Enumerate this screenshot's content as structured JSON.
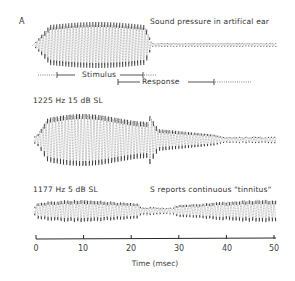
{
  "panel_label": "A",
  "chart_data": {
    "type": "line",
    "title": "",
    "xlabel": "Time (msec)",
    "ylabel": "",
    "xlim": [
      0,
      50
    ],
    "x_ticks": [
      0,
      10,
      20,
      30,
      40,
      50
    ],
    "tick_labels": [
      "0",
      "10",
      "20",
      "30",
      "40",
      "50"
    ],
    "grid": false,
    "traces": [
      {
        "name": "Sound pressure in artificial ear",
        "label": "Sound pressure in artifical ear",
        "description": "Tone burst stimulus; high-amplitude oscillation ~0-15 msec, then low-level noise to 50 msec",
        "burst_start_ms": 0,
        "burst_end_ms": 15,
        "peak_amplitude_rel": 1.0,
        "tail_amplitude_rel": 0.05
      },
      {
        "name": "1225 Hz 15 dB SL",
        "label": "1225 Hz  15 dB SL",
        "description": "Ear response; large burst ~0-21 msec, decaying ringing to ~32 msec, low-level tail to 50 msec",
        "burst_start_ms": 0,
        "burst_end_ms": 21,
        "peak_amplitude_rel": 1.0,
        "tail_amplitude_rel": 0.15
      },
      {
        "name": "1177 Hz 5 dB SL",
        "label": "1177 Hz  5 dB SL",
        "annotation": "S reports continuous \"tinnitus\"",
        "description": "Continuous oscillation throughout 0-50 msec with slowly varying amplitude",
        "burst_start_ms": 0,
        "burst_end_ms": 50,
        "peak_amplitude_rel": 0.45,
        "tail_amplitude_rel": 0.3
      }
    ],
    "brackets": [
      {
        "label": "Stimulus",
        "start_ms": 4.5,
        "end_ms": 22.5
      },
      {
        "label": "Response",
        "start_ms": 17.5,
        "end_ms": 37.5
      }
    ]
  },
  "labels": {
    "trace1": "Sound pressure in artifical ear",
    "stimulus": "Stimulus",
    "response": "Response",
    "trace2": "1225 Hz  15 dB SL",
    "trace3": "1177 Hz  5 dB SL",
    "trace3_note": "S reports continuous \"tinnitus\"",
    "xlabel": "Time (msec)"
  },
  "ticks": [
    "0",
    "10",
    "20",
    "30",
    "40",
    "50"
  ],
  "colors": {
    "ink": "#2a2a2a",
    "faint": "#777777"
  }
}
